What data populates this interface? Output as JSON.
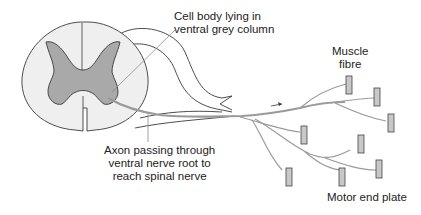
{
  "diagram": {
    "labels": {
      "cell_body": [
        "Cell body lying in",
        "ventral grey column"
      ],
      "axon": [
        "Axon passing through",
        "ventral nerve root to",
        "reach spinal nerve"
      ],
      "muscle": [
        "Muscle",
        "fibre"
      ],
      "end_plate": "Motor end plate"
    },
    "colors": {
      "outline": "#3a3a3a",
      "grey_matter": "#a9a9a9",
      "white_matter": "#efefef",
      "axon": "#9a9a9a",
      "muscle_fibre": "#c8c8c8",
      "leader_line": "#8a8a8a"
    }
  }
}
